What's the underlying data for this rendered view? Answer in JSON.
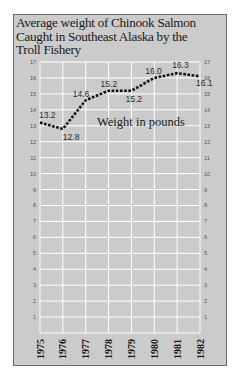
{
  "chart_data": {
    "type": "line",
    "title": "Average weight of Chinook Salmon Caught in Southeast Alaska by the Troll Fishery",
    "title_lines": [
      "Average weight of Chinook Salmon",
      "Caught in Southeast Alaska by the",
      "Troll Fishery"
    ],
    "xlabel": "",
    "ylabel": "Weight in pounds",
    "annotation": "Weight in pounds",
    "categories": [
      "1975",
      "1976",
      "1977",
      "1978",
      "1979",
      "1980",
      "1981",
      "1982"
    ],
    "series": [
      {
        "name": "Average weight (lbs)",
        "values": [
          13.2,
          12.8,
          14.6,
          15.2,
          15.2,
          16.0,
          16.3,
          16.1
        ],
        "labels": [
          "13.2",
          "12.8",
          "14.6",
          "15.2",
          "15.2",
          "16.0",
          "16.3",
          "16.1"
        ],
        "style": "dotted"
      }
    ],
    "ylim": [
      0,
      17
    ],
    "yticks": [
      1,
      2,
      3,
      4,
      5,
      6,
      7,
      8,
      9,
      10,
      11,
      12,
      13,
      14,
      15,
      16,
      17
    ],
    "yticks_both_sides": true,
    "grid": true,
    "legend": "none",
    "colors": {
      "background": "#cbcbcb",
      "grid": "#ffffff",
      "line": "#111111",
      "frame": "#6a6a6a"
    }
  }
}
